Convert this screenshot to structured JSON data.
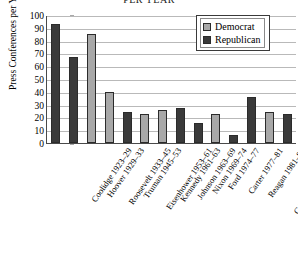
{
  "chart_data": {
    "type": "bar",
    "title": "PER YEAR",
    "xlabel": "",
    "ylabel": "Press Conferences per Year",
    "ylim": [
      0,
      100
    ],
    "ytick_values": [
      100,
      90,
      80,
      70,
      60,
      50,
      40,
      30,
      20,
      10,
      0
    ],
    "grid": true,
    "legend_position": "top-right",
    "legend": [
      {
        "name": "Democrat",
        "color": "#a8a8a8"
      },
      {
        "name": "Republican",
        "color": "#3a3a3a"
      }
    ],
    "categories": [
      "Coolidge 1923–29",
      "Hoover 1929–33",
      "Roosevelt 1933–45",
      "Truman 1945–53",
      "Eisenhower 1953–61",
      "Kennedy 1961–63",
      "Johnson 1963–69",
      "Nixon 1969–74",
      "Ford 1974–77",
      "Carter 1977–81",
      "Reagan 1981–89",
      "G.H.W. Bush 1989–93",
      "Clinton 1993–2001",
      "G.W. Bush 2001–04"
    ],
    "values": [
      93,
      67,
      85,
      40,
      24,
      23,
      26,
      27,
      16,
      23,
      6,
      36,
      24,
      23
    ],
    "parties": [
      "Republican",
      "Republican",
      "Democrat",
      "Democrat",
      "Republican",
      "Democrat",
      "Democrat",
      "Republican",
      "Republican",
      "Democrat",
      "Republican",
      "Republican",
      "Democrat",
      "Republican"
    ]
  }
}
